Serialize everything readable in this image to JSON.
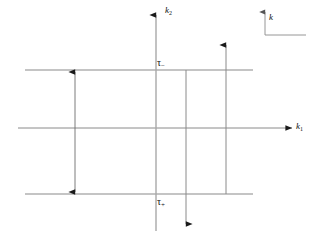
{
  "figure": {
    "kind": "vector-diagram",
    "background_color": "#ffffff",
    "line_color": "#8a8a8a",
    "arrow_color": "#1a1a1a",
    "text_color": "#111111",
    "width": 319,
    "height": 236
  },
  "axes": {
    "horizontal": {
      "label": "k",
      "subscript": "1",
      "name": "k1-axis",
      "x_start": 18,
      "x_end": 294,
      "y": 128
    },
    "vertical": {
      "label": "k",
      "subscript": "2",
      "name": "k2-axis",
      "x": 156,
      "y_start": 231,
      "y_end": 12
    }
  },
  "contour_lines": [
    {
      "name": "upper-branch-line",
      "y": 70,
      "x_start": 25,
      "x_end": 253
    },
    {
      "name": "lower-branch-line",
      "y": 194,
      "x_start": 25,
      "x_end": 253
    }
  ],
  "labels": {
    "tau_minus": {
      "text": "τ",
      "subscript": "−",
      "x": 157,
      "y": 60
    },
    "tau_plus": {
      "text": "τ",
      "subscript": "+",
      "x": 157,
      "y": 198
    },
    "frame_marker": {
      "text": "k",
      "x": 268,
      "y": 14
    }
  },
  "arrows": [
    {
      "name": "gap-double-arrow",
      "type": "double-headed-vertical",
      "x": 75,
      "y_top": 70,
      "y_bottom": 194
    },
    {
      "name": "down-arrow",
      "type": "single-headed-down",
      "x": 186,
      "y_top": 70,
      "y_bottom": 226
    },
    {
      "name": "up-arrow",
      "type": "single-headed-up",
      "x": 226,
      "y_top": 43,
      "y_bottom": 194
    }
  ],
  "frame_marker": {
    "name": "orientation-frame",
    "corner_x": 265,
    "corner_y": 35,
    "arm_up_y": 10,
    "arm_right_x": 306
  }
}
